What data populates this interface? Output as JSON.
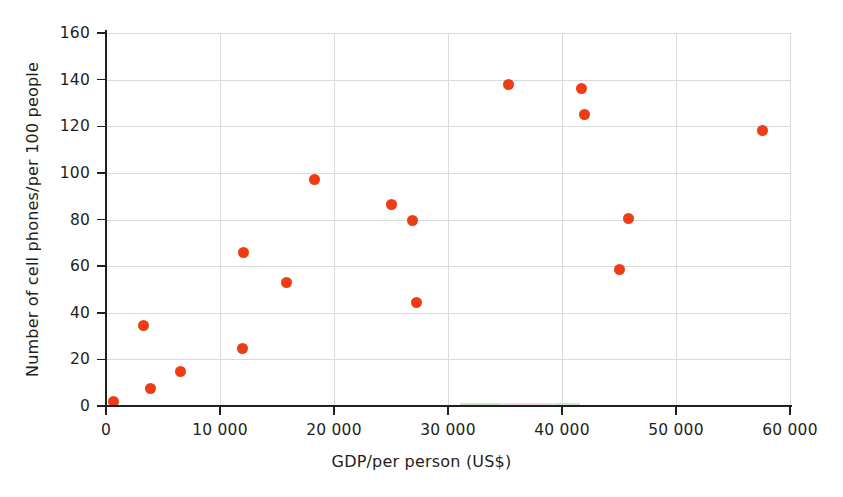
{
  "chart_data": {
    "type": "scatter",
    "title": "",
    "xlabel": "GDP/per person (US$)",
    "ylabel": "Number of cell phones/per 100 people",
    "xlim": [
      0,
      60000
    ],
    "ylim": [
      0,
      160
    ],
    "xticks": [
      0,
      10000,
      20000,
      30000,
      40000,
      50000,
      60000
    ],
    "xtick_labels": [
      "0",
      "10 000",
      "20 000",
      "30 000",
      "40 000",
      "50 000",
      "60 000"
    ],
    "yticks": [
      0,
      20,
      40,
      60,
      80,
      100,
      120,
      140,
      160
    ],
    "ytick_labels": [
      "0",
      "20",
      "40",
      "60",
      "80",
      "100",
      "120",
      "140",
      "160"
    ],
    "grid": true,
    "legend": false,
    "marker_color": "#f03c15",
    "marker_shape": "circle",
    "points": [
      {
        "x": 700,
        "y": 2
      },
      {
        "x": 3300,
        "y": 34.5
      },
      {
        "x": 3900,
        "y": 7.5
      },
      {
        "x": 6500,
        "y": 15
      },
      {
        "x": 12000,
        "y": 24.5
      },
      {
        "x": 12100,
        "y": 66
      },
      {
        "x": 15800,
        "y": 53
      },
      {
        "x": 18300,
        "y": 97
      },
      {
        "x": 25000,
        "y": 86.5
      },
      {
        "x": 26900,
        "y": 79.5
      },
      {
        "x": 27200,
        "y": 44.5
      },
      {
        "x": 35300,
        "y": 138
      },
      {
        "x": 41700,
        "y": 136
      },
      {
        "x": 42000,
        "y": 125
      },
      {
        "x": 45000,
        "y": 58.5
      },
      {
        "x": 45800,
        "y": 80.5
      },
      {
        "x": 57600,
        "y": 118
      }
    ]
  },
  "axes": {
    "x_title": "GDP/per person (US$)",
    "y_title": "Number of cell phones/per 100 people"
  },
  "artifacts": {
    "bottom_sliver_text": "",
    "baseline_fringes": [
      {
        "left": 460,
        "width": 42,
        "color": "#7ec87e"
      },
      {
        "left": 502,
        "width": 52,
        "color": "#e79fe0"
      },
      {
        "left": 554,
        "width": 26,
        "color": "#8fcb8f"
      }
    ]
  }
}
